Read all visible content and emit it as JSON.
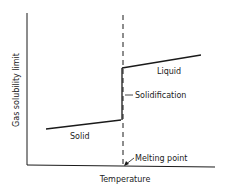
{
  "diagram": {
    "ylabel": "Gas solubility limit",
    "xlabel": "Temperature",
    "labels": {
      "solid": "Solid",
      "liquid": "Liquid",
      "solidification": "Solidification",
      "melting_point": "Melting point"
    },
    "colors": {
      "line": "#1a1a1a",
      "background": "#ffffff"
    }
  }
}
